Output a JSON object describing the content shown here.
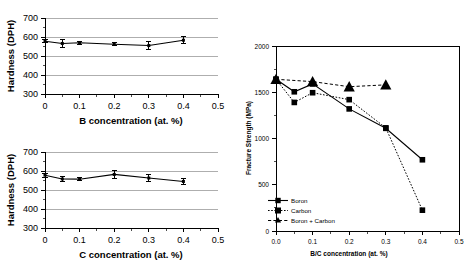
{
  "figure": {
    "background": "#ffffff",
    "axis_color": "#000000",
    "grid_color": "#9a9a9a"
  },
  "chart_data": [
    {
      "id": "hardness-vs-boron",
      "type": "line",
      "title": "",
      "xlabel": "B concentration (at. %)",
      "ylabel": "Hardness (DPH)",
      "xlim": [
        0,
        0.5
      ],
      "ylim": [
        300,
        700
      ],
      "xticks": [
        0,
        0.1,
        0.2,
        0.3,
        0.4,
        0.5
      ],
      "xticklabels": [
        "0",
        "0.1",
        "0.2",
        "0.3",
        "0.4",
        "0.5"
      ],
      "yticks": [
        300,
        400,
        500,
        600,
        700
      ],
      "yticklabels": [
        "300",
        "400",
        "500",
        "600",
        "700"
      ],
      "grid": "horizontal",
      "legend": "none",
      "series": [
        {
          "name": "Hardness",
          "marker": "square",
          "line": "solid",
          "x": [
            0.0,
            0.05,
            0.1,
            0.2,
            0.3,
            0.4
          ],
          "values": [
            578,
            566,
            570,
            562,
            555,
            583
          ],
          "yerr": [
            8,
            20,
            7,
            7,
            22,
            18
          ]
        }
      ]
    },
    {
      "id": "hardness-vs-carbon",
      "type": "line",
      "title": "",
      "xlabel": "C concentration (at. %)",
      "ylabel": "Hardness (DPH)",
      "xlim": [
        0,
        0.5
      ],
      "ylim": [
        300,
        700
      ],
      "xticks": [
        0,
        0.1,
        0.2,
        0.3,
        0.4,
        0.5
      ],
      "xticklabels": [
        "0",
        "0.1",
        "0.2",
        "0.3",
        "0.4",
        "0.5"
      ],
      "yticks": [
        300,
        400,
        500,
        600,
        700
      ],
      "yticklabels": [
        "300",
        "400",
        "500",
        "600",
        "700"
      ],
      "grid": "horizontal",
      "legend": "none",
      "series": [
        {
          "name": "Hardness",
          "marker": "square",
          "line": "solid",
          "x": [
            0.0,
            0.05,
            0.1,
            0.2,
            0.3,
            0.4
          ],
          "values": [
            578,
            558,
            557,
            582,
            563,
            545
          ],
          "yerr": [
            10,
            14,
            7,
            22,
            16,
            14
          ]
        }
      ]
    },
    {
      "id": "fracture-strength-vs-bc",
      "type": "line",
      "title": "",
      "xlabel": "B/C concentration (at. %)",
      "ylabel": "Fracture Strength (MPa)",
      "xlim": [
        0.0,
        0.5
      ],
      "ylim": [
        0,
        2000
      ],
      "xticks": [
        0.0,
        0.1,
        0.2,
        0.3,
        0.4,
        0.5
      ],
      "xticklabels": [
        "0.0",
        "0.1",
        "0.2",
        "0.3",
        "0.4",
        "0.5"
      ],
      "yticks": [
        0,
        500,
        1000,
        1500,
        2000
      ],
      "yticklabels": [
        "0",
        "500",
        "1000",
        "1500",
        "2000"
      ],
      "grid": "none",
      "legend": "lower-left",
      "series": [
        {
          "name": "Boron",
          "marker": "square",
          "line": "solid",
          "x": [
            0.0,
            0.05,
            0.1,
            0.2,
            0.3,
            0.4
          ],
          "values": [
            1640,
            1505,
            1590,
            1320,
            1110,
            770
          ]
        },
        {
          "name": "Carbon",
          "marker": "square",
          "line": "dotted",
          "x": [
            0.0,
            0.05,
            0.1,
            0.2,
            0.3,
            0.4
          ],
          "values": [
            1640,
            1390,
            1495,
            1420,
            1115,
            225
          ]
        },
        {
          "name": "Boron + Carbon",
          "marker": "triangle",
          "line": "dashed",
          "x": [
            0.0,
            0.1,
            0.2,
            0.3
          ],
          "values": [
            1640,
            1615,
            1560,
            1580
          ]
        }
      ]
    }
  ]
}
